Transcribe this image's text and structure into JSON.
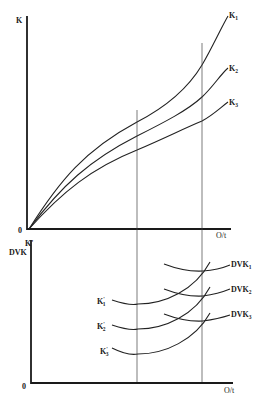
{
  "diagram": {
    "top_panel": {
      "y_axis_label": "K",
      "origin_label": "0",
      "x_axis_label": "O/t",
      "curves": [
        {
          "name": "K",
          "sub": "1"
        },
        {
          "name": "K",
          "sub": "2"
        },
        {
          "name": "K",
          "sub": "3"
        }
      ]
    },
    "bottom_panel": {
      "y_axis_label_line1": "K'",
      "y_axis_label_line2": "DVK",
      "origin_label": "0",
      "x_axis_label": "O/t",
      "marginal_curves": [
        {
          "name": "K",
          "sub": "1",
          "prime": "'"
        },
        {
          "name": "K",
          "sub": "2",
          "prime": "'"
        },
        {
          "name": "K",
          "sub": "3",
          "prime": "'"
        }
      ],
      "average_curves": [
        {
          "name": "DVK",
          "sub": "1"
        },
        {
          "name": "DVK",
          "sub": "2"
        },
        {
          "name": "DVK",
          "sub": "3"
        }
      ]
    },
    "colors": {
      "ink": "#1a1a1a",
      "background": "#ffffff"
    }
  }
}
